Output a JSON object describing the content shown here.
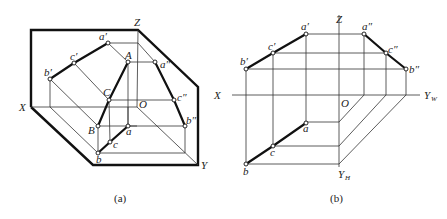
{
  "figure_a": {
    "caption": "(a)",
    "axes": {
      "X": "X",
      "Y": "Y",
      "Z": "Z",
      "O": "O"
    },
    "points": {
      "a_prime": "a′",
      "b_prime": "b′",
      "c_prime": "c′",
      "a_dprime": "a″",
      "b_dprime": "b″",
      "c_dprime": "c″",
      "A": "A",
      "B": "B",
      "C": "C",
      "a": "a",
      "b": "b",
      "c": "c"
    }
  },
  "figure_b": {
    "caption": "(b)",
    "axes": {
      "X": "X",
      "Z": "Z",
      "O": "O",
      "YW": "Y",
      "YW_sub": "W",
      "YH": "Y",
      "YH_sub": "H"
    },
    "points": {
      "a_prime": "a′",
      "b_prime": "b′",
      "c_prime": "c′",
      "a_dprime": "a″",
      "b_dprime": "b″",
      "c_dprime": "c″",
      "a": "a",
      "b": "b",
      "c": "c"
    }
  }
}
